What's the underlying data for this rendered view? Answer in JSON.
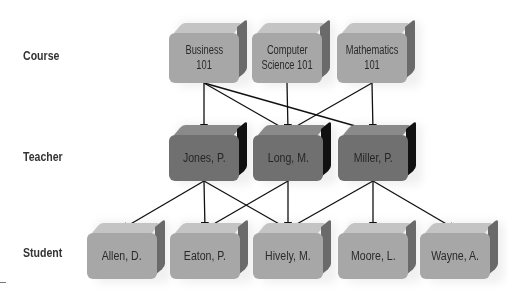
{
  "rows": [
    {
      "id": "course",
      "label": "Course"
    },
    {
      "id": "teacher",
      "label": "Teacher"
    },
    {
      "id": "student",
      "label": "Student"
    }
  ],
  "nodes": {
    "course": [
      {
        "id": "business-101",
        "label": "Business 101",
        "lines": [
          "Business",
          "101"
        ]
      },
      {
        "id": "computer-science-101",
        "label": "Computer Science 101",
        "lines": [
          "Computer",
          "Science 101"
        ]
      },
      {
        "id": "mathematics-101",
        "label": "Mathematics 101",
        "lines": [
          "Mathematics",
          "101"
        ]
      }
    ],
    "teacher": [
      {
        "id": "jones-p",
        "label": "Jones, P."
      },
      {
        "id": "long-m",
        "label": "Long, M."
      },
      {
        "id": "miller-p",
        "label": "Miller, P."
      }
    ],
    "student": [
      {
        "id": "allen-d",
        "label": "Allen, D."
      },
      {
        "id": "eaton-p",
        "label": "Eaton, P."
      },
      {
        "id": "hively-m",
        "label": "Hively, M."
      },
      {
        "id": "moore-l",
        "label": "Moore, L."
      },
      {
        "id": "wayne-a",
        "label": "Wayne, A."
      }
    ]
  },
  "edges": [
    [
      "business-101",
      "jones-p"
    ],
    [
      "business-101",
      "long-m"
    ],
    [
      "business-101",
      "miller-p"
    ],
    [
      "computer-science-101",
      "long-m"
    ],
    [
      "mathematics-101",
      "long-m"
    ],
    [
      "mathematics-101",
      "miller-p"
    ],
    [
      "jones-p",
      "allen-d"
    ],
    [
      "jones-p",
      "eaton-p"
    ],
    [
      "jones-p",
      "hively-m"
    ],
    [
      "long-m",
      "eaton-p"
    ],
    [
      "long-m",
      "hively-m"
    ],
    [
      "miller-p",
      "hively-m"
    ],
    [
      "miller-p",
      "moore-l"
    ],
    [
      "miller-p",
      "wayne-a"
    ]
  ],
  "colors": {
    "course_box": "#a7a7a7",
    "teacher_box": "#707070",
    "student_box": "#a7a7a7",
    "arrow": "#111111"
  }
}
